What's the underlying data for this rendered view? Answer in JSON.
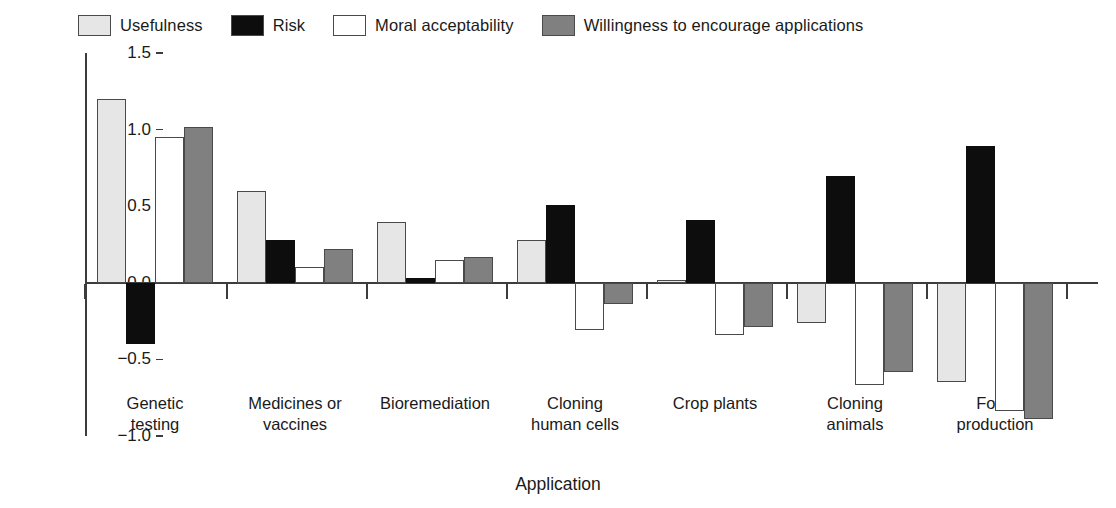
{
  "chart_data": {
    "type": "bar",
    "title": "",
    "xlabel": "Application",
    "ylabel": "Negative/positive evaluation (−2 to +2)",
    "ylim": [
      -1.0,
      1.5
    ],
    "yticks": [
      1.5,
      1.0,
      0.5,
      0.0,
      -0.5,
      -1.0
    ],
    "ytick_labels": [
      "1.5",
      "1.0",
      "0.5",
      "0.0",
      "−0.5",
      "−1.0"
    ],
    "grid": false,
    "legend_position": "top",
    "categories": [
      "Genetic\ntesting",
      "Medicines or\nvaccines",
      "Bioremediation",
      "Cloning\nhuman cells",
      "Crop plants",
      "Cloning\nanimals",
      "Food\nproduction"
    ],
    "series": [
      {
        "name": "Usefulness",
        "color": "#e6e6e6",
        "values": [
          1.2,
          0.6,
          0.4,
          0.28,
          0.02,
          -0.26,
          -0.65
        ]
      },
      {
        "name": "Risk",
        "color": "#0d0d0d",
        "values": [
          -0.4,
          0.28,
          0.03,
          0.51,
          0.41,
          0.7,
          0.89
        ]
      },
      {
        "name": "Moral acceptability",
        "color": "#ffffff",
        "values": [
          0.95,
          0.1,
          0.15,
          -0.31,
          -0.34,
          -0.67,
          -0.84
        ]
      },
      {
        "name": "Willingness to encourage applications",
        "color": "#808080",
        "values": [
          1.02,
          0.22,
          0.17,
          -0.14,
          -0.29,
          -0.58,
          -0.89
        ]
      }
    ]
  },
  "legend": {
    "items": [
      {
        "label": "Usefulness",
        "swatch": "#e6e6e6"
      },
      {
        "label": "Risk",
        "swatch": "#0d0d0d"
      },
      {
        "label": "Moral acceptability",
        "swatch": "#ffffff"
      },
      {
        "label": "Willingness to encourage applications",
        "swatch": "#808080"
      }
    ]
  }
}
